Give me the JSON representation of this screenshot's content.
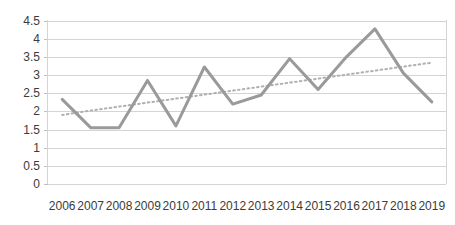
{
  "chart_data": {
    "type": "line",
    "title": "",
    "subtitle": "",
    "xlabel": "",
    "ylabel": "",
    "categories": [
      "2006",
      "2007",
      "2008",
      "2009",
      "2010",
      "2011",
      "2012",
      "2013",
      "2014",
      "2015",
      "2016",
      "2017",
      "2018",
      "2019"
    ],
    "series": [
      {
        "name": "series-1",
        "style": "solid",
        "color": "#9a9a9a",
        "values": [
          2.33,
          1.55,
          1.55,
          2.85,
          1.6,
          3.22,
          2.2,
          2.45,
          3.45,
          2.6,
          3.5,
          4.27,
          3.05,
          2.26
        ]
      },
      {
        "name": "trendline",
        "style": "dotted",
        "color": "#b0b0b0",
        "values": [
          1.9,
          2.02,
          2.13,
          2.24,
          2.35,
          2.46,
          2.57,
          2.68,
          2.79,
          2.9,
          3.01,
          3.12,
          3.23,
          3.34
        ]
      }
    ],
    "ylim": [
      0,
      4.5
    ],
    "ytick_values": [
      "0",
      "0.5",
      "1",
      "1.5",
      "2",
      "2.5",
      "3",
      "3.5",
      "4",
      "4.5"
    ],
    "grid": true,
    "grid_axis": "y",
    "legend": false,
    "legend_position": "none",
    "annotations": []
  },
  "colors": {
    "series": "#9a9a9a",
    "trend": "#b0b0b0",
    "grid": "#d4d4d4",
    "axis": "#d4d4d4",
    "text": "#3b3b3b",
    "background": "#ffffff"
  }
}
